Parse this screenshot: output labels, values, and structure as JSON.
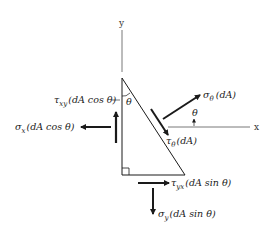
{
  "diagram": {
    "axes": {
      "x_label": "x",
      "y_label": "y"
    },
    "angle_labels": {
      "top_vertex": "θ",
      "normal_angle": "θ"
    },
    "forces": {
      "tau_xy": {
        "symbol": "τ",
        "subscript": "xy",
        "expr": "(dA cos θ)"
      },
      "sigma_x": {
        "symbol": "σ",
        "subscript": "x",
        "expr": "(dA cos θ)"
      },
      "sigma_theta": {
        "symbol": "σ",
        "subscript": "θ",
        "expr": "(dA)"
      },
      "tau_theta": {
        "symbol": "τ",
        "subscript": "θ",
        "expr": "(dA)"
      },
      "tau_yx": {
        "symbol": "τ",
        "subscript": "yx",
        "expr": "(dA sin θ)"
      },
      "sigma_y": {
        "symbol": "σ",
        "subscript": "y",
        "expr": "(dA sin θ)"
      }
    },
    "colors": {
      "line": "#1a1a1a",
      "axis": "#555555",
      "background": "#ffffff"
    }
  }
}
